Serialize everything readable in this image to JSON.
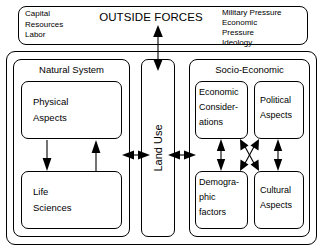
{
  "diagram": {
    "title": "OUTSIDE FORCES",
    "type": "systems-block-diagram",
    "banner": {
      "title": "OUTSIDE FORCES",
      "left_items": "Capital\nResources\nLabor",
      "left_items_list": [
        "Capital",
        "Resources",
        "Labor"
      ],
      "right_items": "Military Pressure\nEconomic\nPressure\nIdeology",
      "right_items_list": [
        "Military Pressure",
        "Economic",
        "Pressure",
        "Ideology"
      ]
    },
    "natural_system": {
      "title": "Natural System",
      "boxes": [
        {
          "label": "Physical\nAspects",
          "name": "physical-aspects"
        },
        {
          "label": "Life\nSciences",
          "name": "life-sciences"
        }
      ]
    },
    "center": {
      "label": "Land Use",
      "orientation": "vertical-bottom-to-top"
    },
    "socio_economic": {
      "title": "Socio-Economic",
      "boxes": [
        {
          "label": "Economic\nConsider-\nations",
          "name": "economic-considerations"
        },
        {
          "label": "Political\nAspects",
          "name": "political-aspects"
        },
        {
          "label": "Demogra-\nphic\nfactors",
          "name": "demographic-factors"
        },
        {
          "label": "Cultural\nAspects",
          "name": "cultural-aspects"
        }
      ]
    },
    "connectors": [
      {
        "name": "outside-forces-to-system",
        "style": "double-headed-vertical"
      },
      {
        "name": "physical-to-life-sciences",
        "style": "single-headed-down"
      },
      {
        "name": "life-sciences-to-physical",
        "style": "single-headed-up"
      },
      {
        "name": "natural-system-to-land-use",
        "style": "double-headed-horizontal"
      },
      {
        "name": "land-use-to-socio-economic",
        "style": "double-headed-horizontal"
      },
      {
        "name": "economic-to-demographic",
        "style": "double-headed-vertical"
      },
      {
        "name": "political-to-cultural",
        "style": "double-headed-vertical"
      },
      {
        "name": "socio-economic-cross-links",
        "style": "four-way-x-cross"
      }
    ],
    "colors": {
      "stroke": "#000000",
      "background": "#ffffff"
    }
  }
}
